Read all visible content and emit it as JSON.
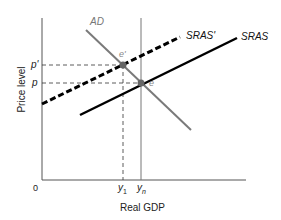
{
  "diagram": {
    "title": "",
    "axes": {
      "x_label": "Real GDP",
      "y_label": "Price level",
      "origin_label": "0"
    },
    "curves": [
      {
        "id": "AD",
        "label": "AD",
        "style": "solid",
        "color": "#808080"
      },
      {
        "id": "SRAS",
        "label": "SRAS",
        "style": "solid",
        "color": "#000000"
      },
      {
        "id": "SRAS_prime",
        "label": "SRAS'",
        "style": "dashed",
        "color": "#000000"
      }
    ],
    "points": [
      {
        "id": "e",
        "label": "e"
      },
      {
        "id": "e_prime",
        "label": "e'"
      }
    ],
    "price_ticks": {
      "p_prime": "p'",
      "p": "p"
    },
    "output_ticks": {
      "y1_main": "y",
      "y1_sub": "1",
      "yn_main": "y",
      "yn_sub": "n"
    },
    "colors": {
      "axis": "#555555",
      "ad": "#7a7a7a",
      "sras": "#000000",
      "point": "#666666",
      "guide": "#333333"
    }
  }
}
